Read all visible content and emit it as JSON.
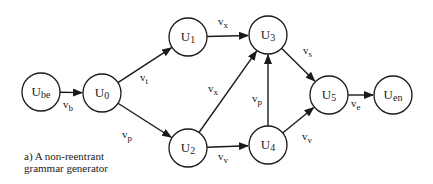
{
  "caption": {
    "line1": "a) A non-reentrant",
    "line2": "grammar generator"
  },
  "nodes": [
    {
      "id": "Ube",
      "main": "U",
      "sub": "be",
      "cx": 41,
      "cy": 92
    },
    {
      "id": "U0",
      "main": "U",
      "sub": "0",
      "cx": 102,
      "cy": 93
    },
    {
      "id": "U1",
      "main": "U",
      "sub": "1",
      "cx": 188,
      "cy": 37
    },
    {
      "id": "U2",
      "main": "U",
      "sub": "2",
      "cx": 188,
      "cy": 148
    },
    {
      "id": "U3",
      "main": "U",
      "sub": "3",
      "cx": 268,
      "cy": 35
    },
    {
      "id": "U4",
      "main": "U",
      "sub": "4",
      "cx": 268,
      "cy": 145
    },
    {
      "id": "U5",
      "main": "U",
      "sub": "5",
      "cx": 329,
      "cy": 95
    },
    {
      "id": "Uen",
      "main": "U",
      "sub": "en",
      "cx": 393,
      "cy": 95
    }
  ],
  "edges": [
    {
      "from": "Ube",
      "to": "U0",
      "label_main": "v",
      "label_sub": "b",
      "lx": 63,
      "ly": 108
    },
    {
      "from": "U0",
      "to": "U1",
      "label_main": "v",
      "label_sub": "t",
      "lx": 140,
      "ly": 81
    },
    {
      "from": "U0",
      "to": "U2",
      "label_main": "v",
      "label_sub": "p",
      "lx": 122,
      "ly": 138
    },
    {
      "from": "U1",
      "to": "U3",
      "label_main": "v",
      "label_sub": "x",
      "lx": 218,
      "ly": 25
    },
    {
      "from": "U2",
      "to": "U3",
      "label_main": "v",
      "label_sub": "x",
      "lx": 208,
      "ly": 92
    },
    {
      "from": "U2",
      "to": "U4",
      "label_main": "v",
      "label_sub": "v",
      "lx": 218,
      "ly": 160
    },
    {
      "from": "U4",
      "to": "U3",
      "label_main": "v",
      "label_sub": "p",
      "lx": 252,
      "ly": 102
    },
    {
      "from": "U3",
      "to": "U5",
      "label_main": "v",
      "label_sub": "s",
      "lx": 303,
      "ly": 54
    },
    {
      "from": "U4",
      "to": "U5",
      "label_main": "v",
      "label_sub": "v",
      "lx": 302,
      "ly": 140
    },
    {
      "from": "U5",
      "to": "Uen",
      "label_main": "v",
      "label_sub": "e",
      "lx": 351,
      "ly": 107
    }
  ],
  "style": {
    "stroke": "#1a1a1a",
    "background": "#ffffff",
    "node_radius": 19
  }
}
